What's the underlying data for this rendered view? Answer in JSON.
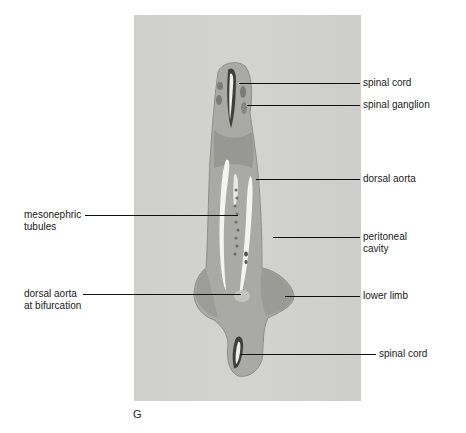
{
  "figure": {
    "letter": "G",
    "panel_bg": "#d1d1cf",
    "labels_right": [
      {
        "id": "spinal-cord-top",
        "text": "spinal cord"
      },
      {
        "id": "spinal-ganglion",
        "text": "spinal ganglion"
      },
      {
        "id": "dorsal-aorta",
        "text": "dorsal aorta"
      },
      {
        "id": "peritoneal-cavity-1",
        "text": "peritoneal"
      },
      {
        "id": "peritoneal-cavity-2",
        "text": "cavity"
      },
      {
        "id": "lower-limb",
        "text": "lower limb"
      },
      {
        "id": "spinal-cord-bottom",
        "text": "spinal cord"
      }
    ],
    "labels_left": [
      {
        "id": "mesonephric-1",
        "text": "mesonephric"
      },
      {
        "id": "mesonephric-2",
        "text": "tubules"
      },
      {
        "id": "dorsal-aorta-bif-1",
        "text": "dorsal aorta"
      },
      {
        "id": "dorsal-aorta-bif-2",
        "text": "at bifurcation"
      }
    ]
  }
}
